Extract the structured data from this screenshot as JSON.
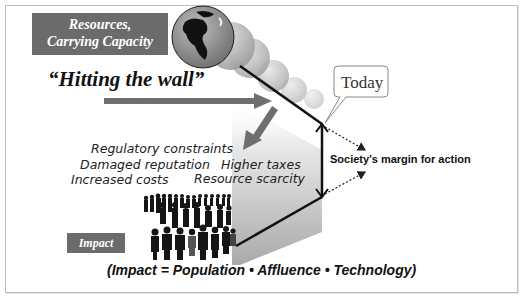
{
  "diagram": {
    "resources_label": {
      "line1": "Resources,",
      "line2": "Carrying Capacity"
    },
    "hitting_the_wall": "“Hitting the wall”",
    "today_callout": "Today",
    "consequences": [
      {
        "text": "Regulatory constraints"
      },
      {
        "text": "Damaged reputation"
      },
      {
        "text": "Increased costs"
      },
      {
        "text": "Higher taxes"
      },
      {
        "text": "Resource scarcity"
      }
    ],
    "margin_label": "Society's margin for action",
    "impact_label": "Impact",
    "formula": "(Impact = Population • Affluence • Technology)",
    "icons": {
      "globe": "globe-icon",
      "people": "crowd-icon"
    },
    "colors": {
      "label_box": "#6b6b6b",
      "arrow": "#707070",
      "line": "#111111",
      "gradient_top": "#f4f4f4",
      "gradient_bottom": "#a8a8a8"
    }
  }
}
